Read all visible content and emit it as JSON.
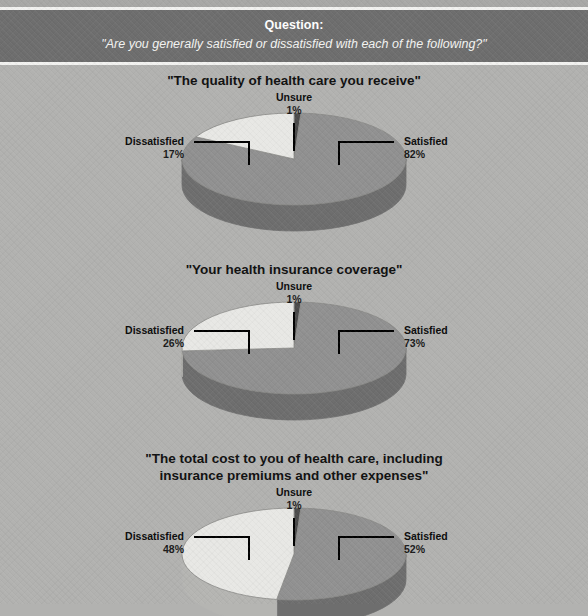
{
  "header": {
    "pretitle": "Question:",
    "question": "\"Are you generally satisfied or dissatisfied with each of the following?\""
  },
  "colors": {
    "background": "#b2b2b0",
    "header_band": "#6e6e6e",
    "rule": "#f2f2f0",
    "satisfied_top": "#919191",
    "satisfied_side": "#6e6e6e",
    "dissatisfied_top": "#e8e8e5",
    "dissatisfied_side": "#b5b5b2",
    "unsure_top": "#4a4a4a",
    "unsure_side": "#3a3a3a",
    "label_text": "#0c0c0c"
  },
  "labels": {
    "satisfied": "Satisfied",
    "dissatisfied": "Dissatisfied",
    "unsure": "Unsure"
  },
  "chart_data": [
    {
      "type": "pie",
      "title": "\"The quality of health care you receive\"",
      "categories": [
        "Unsure",
        "Satisfied",
        "Dissatisfied"
      ],
      "values": [
        1,
        82,
        17
      ],
      "value_labels": [
        "1%",
        "82%",
        "17%"
      ],
      "legend_position": "callouts",
      "start_angle": 0
    },
    {
      "type": "pie",
      "title": "\"Your health insurance coverage\"",
      "categories": [
        "Unsure",
        "Satisfied",
        "Dissatisfied"
      ],
      "values": [
        1,
        73,
        26
      ],
      "value_labels": [
        "1%",
        "73%",
        "26%"
      ],
      "legend_position": "callouts",
      "start_angle": 0
    },
    {
      "type": "pie",
      "title": "\"The total cost to you of health care, including insurance premiums and other expenses\"",
      "title_line1": "\"The total cost to you of health care, including",
      "title_line2": "insurance premiums and other expenses\"",
      "categories": [
        "Unsure",
        "Satisfied",
        "Dissatisfied"
      ],
      "values": [
        1,
        52,
        48
      ],
      "value_labels": [
        "1%",
        "52%",
        "48%"
      ],
      "legend_position": "callouts",
      "start_angle": 0
    }
  ]
}
